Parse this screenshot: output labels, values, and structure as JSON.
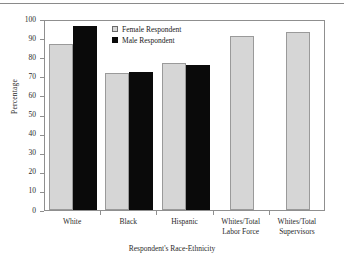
{
  "chart_data": {
    "type": "bar",
    "title": "",
    "xlabel": "Respondent's Race-Ethnicity",
    "ylabel": "Percentage",
    "ylim": [
      0,
      100
    ],
    "ytick_labels": [
      "0",
      "10",
      "20",
      "30",
      "40",
      "50",
      "60",
      "70",
      "80",
      "90",
      "100"
    ],
    "ytick_values": [
      0,
      10,
      20,
      30,
      40,
      50,
      60,
      70,
      80,
      90,
      100
    ],
    "grid": false,
    "legend_position": "upper-center-left",
    "categories": [
      "White",
      "Black",
      "Hispanic",
      "Whites/Total Labor Force",
      "Whites/Total Supervisors"
    ],
    "series": [
      {
        "name": "Female Respondent",
        "color": "#d6d6d6",
        "values": [
          87,
          71.5,
          77,
          91,
          93
        ]
      },
      {
        "name": "Male Respondent",
        "color": "#0a0a0a",
        "values": [
          96.5,
          72.5,
          76,
          null,
          null
        ]
      }
    ]
  },
  "legend": {
    "items": [
      {
        "label": "Female Respondent",
        "swatch": "light-gray-square"
      },
      {
        "label": "Male Respondent",
        "swatch": "black-square"
      }
    ]
  },
  "axes": {
    "y_title": "Percentage",
    "x_title": "Respondent's Race-Ethnicity"
  },
  "x_labels": [
    {
      "line1": "White",
      "line2": ""
    },
    {
      "line1": "Black",
      "line2": ""
    },
    {
      "line1": "Hispanic",
      "line2": ""
    },
    {
      "line1": "Whites/Total",
      "line2": "Labor Force"
    },
    {
      "line1": "Whites/Total",
      "line2": "Supervisors"
    }
  ]
}
